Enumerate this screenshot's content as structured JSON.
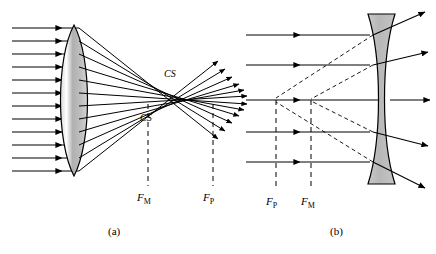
{
  "figure": {
    "panels": [
      {
        "id": "a",
        "caption": "(a)",
        "lens_type": "biconvex-converging",
        "label_cs_upper": "CS",
        "label_cs_lower": "CS",
        "focal_marginal": "F",
        "focal_marginal_sub": "M",
        "focal_paraxial": "F",
        "focal_paraxial_sub": "P",
        "ray_count": 12
      },
      {
        "id": "b",
        "caption": "(b)",
        "lens_type": "biconcave-diverging",
        "focal_paraxial": "F",
        "focal_paraxial_sub": "P",
        "focal_marginal": "F",
        "focal_marginal_sub": "M",
        "ray_count": 5
      }
    ],
    "colors": {
      "line": "#000000",
      "lens_fill": "#b3b3b3",
      "lens_stroke": "#000000",
      "background": "#ffffff"
    }
  }
}
